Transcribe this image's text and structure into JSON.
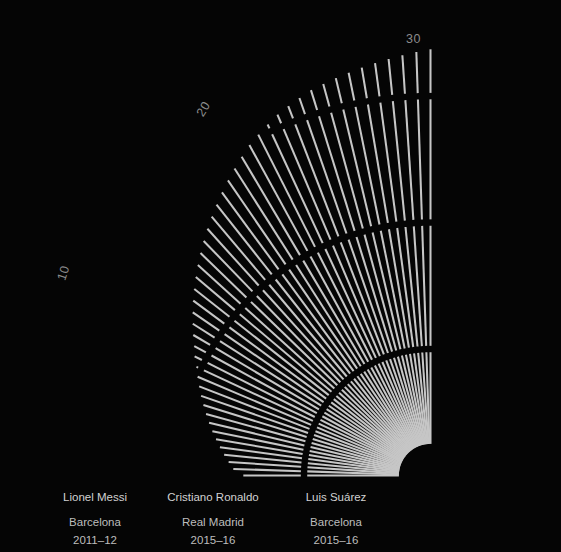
{
  "meta": {
    "background_color": "#050505",
    "bar_color": "#c6c6c6",
    "grid_color": "#050505",
    "label_color": "#8c8c8c",
    "player_label_color": "#c9c9c9"
  },
  "chart_data": {
    "type": "bar",
    "subtype": "polar-radial-bar",
    "title": "",
    "subtitle": "",
    "xlabel": "",
    "ylabel": "",
    "grid": true,
    "legend_position": "none",
    "radial_axis": {
      "ticks": [
        10,
        20,
        30
      ],
      "tick_labels": [
        "10",
        "20",
        "30"
      ],
      "rlim": [
        0,
        34
      ],
      "inner_hole_value": 2.5
    },
    "angular_axis": {
      "start_deg": 180,
      "end_deg": 90,
      "direction": "counterclockwise",
      "bar_count": 48
    },
    "values": [
      14.8,
      15.6,
      16.0,
      16.4,
      16.8,
      17.2,
      17.6,
      18.0,
      18.4,
      18.8,
      19.2,
      19.6,
      20.0,
      20.4,
      20.9,
      21.3,
      21.8,
      22.3,
      22.8,
      23.3,
      23.8,
      24.3,
      24.8,
      25.3,
      25.8,
      26.3,
      26.8,
      27.3,
      27.8,
      28.3,
      28.8,
      29.3,
      29.8,
      30.2,
      30.6,
      31.0,
      31.3,
      31.6,
      31.9,
      32.1,
      32.3,
      32.5,
      32.7,
      32.9,
      33.1,
      33.3,
      33.5,
      33.7
    ],
    "highlighted_indices": [
      0,
      12,
      26
    ],
    "annotations": [
      {
        "index": 0,
        "name": "Lionel Messi",
        "club": "Barcelona",
        "season": "2011–12"
      },
      {
        "index": 12,
        "name": "Cristiano Ronaldo",
        "club": "Real Madrid",
        "season": "2015–16"
      },
      {
        "index": 26,
        "name": "Luis Suárez",
        "club": "Barcelona",
        "season": "2015–16"
      }
    ]
  },
  "radial_ticks": [
    {
      "label": "10",
      "x": 56,
      "y": 266,
      "rotate": -72
    },
    {
      "label": "20",
      "x": 196,
      "y": 102,
      "rotate": -58
    },
    {
      "label": "30",
      "x": 406,
      "y": 32,
      "rotate": 0
    }
  ],
  "player_labels": [
    {
      "name": "Lionel Messi",
      "club": "Barcelona",
      "season": "2011–12",
      "center_x": 95,
      "top": 489
    },
    {
      "name": "Cristiano Ronaldo",
      "club": "Real Madrid",
      "season": "2015–16",
      "center_x": 213,
      "top": 489
    },
    {
      "name": "Luis Suárez",
      "club": "Barcelona",
      "season": "2015–16",
      "center_x": 336,
      "top": 489
    }
  ]
}
